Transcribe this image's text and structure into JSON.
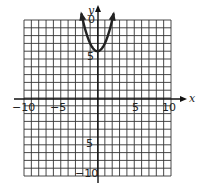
{
  "chart_data": {
    "type": "line",
    "title": "",
    "xlabel": "x",
    "ylabel": "y",
    "xlim": [
      -10,
      10
    ],
    "ylim": [
      -10,
      10
    ],
    "grid": true,
    "x_tick_labels": [
      "-10",
      "-5",
      "5",
      "10"
    ],
    "y_tick_labels": [
      "10",
      "5",
      "-5",
      "-10"
    ],
    "series": [
      {
        "name": "parabola",
        "description": "Upward-opening parabola with vertex at (0, 6), arrows at both ends",
        "vertex": [
          0,
          6
        ],
        "x": [
          -2.2,
          -2,
          -1.5,
          -1,
          -0.5,
          0,
          0.5,
          1,
          1.5,
          2,
          2.2
        ],
        "y": [
          10.8,
          10,
          8.25,
          7,
          6.25,
          6,
          6.25,
          7,
          8.25,
          10,
          10.8
        ]
      }
    ]
  },
  "labels": {
    "x_axis": "x",
    "y_axis": "y",
    "x_neg10": "−10",
    "x_neg5": "−5",
    "x_pos5": "5",
    "x_pos10": "10",
    "y_pos10": "0",
    "y_pos5": "5",
    "y_neg5": "5",
    "y_neg10": "−10"
  }
}
